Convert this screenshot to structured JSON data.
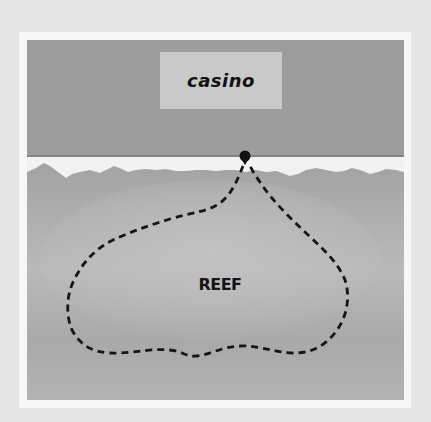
{
  "diagram": {
    "labels": {
      "building": "casino",
      "area": "REEF"
    },
    "elements": {
      "marker": "entry-point-dot",
      "path": "dashed-swim-route-loop"
    },
    "colors": {
      "background": "#e6e6e6",
      "frame": "#f7f7f7",
      "land": "#9d9d9d",
      "beach": "#f2f2f2",
      "water": "#a8a8a8",
      "water_light": "#bdbdbd",
      "casino_box": "#c9c9c9",
      "ink": "#111111"
    }
  }
}
